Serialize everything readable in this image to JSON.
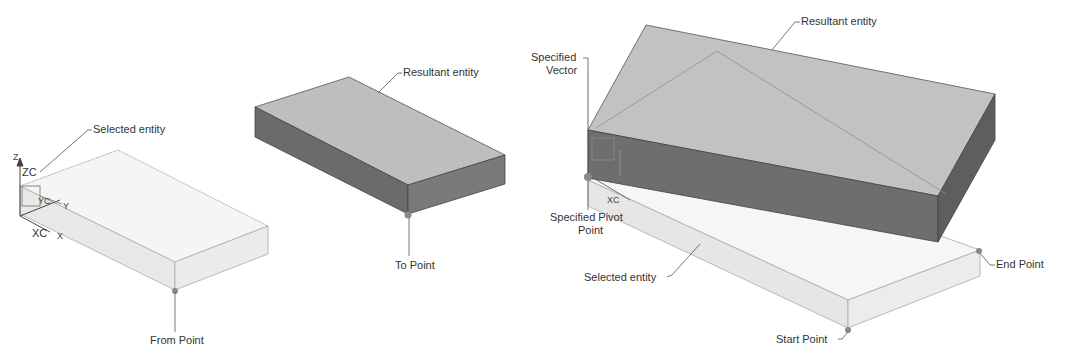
{
  "left_figure": {
    "labels": {
      "selected": "Selected entity",
      "resultant": "Resultant entity",
      "from": "From Point",
      "to": "To Point"
    },
    "axes": {
      "zc": "ZC",
      "yc": "YC",
      "xc": "XC",
      "z": "Z",
      "y": "Y",
      "x": "X"
    }
  },
  "right_figure": {
    "labels": {
      "resultant": "Resultant entity",
      "vector_line1": "Specified",
      "vector_line2": "Vector",
      "pivot_line1": "Specified Pivot",
      "pivot_line2": "Point",
      "selected": "Selected entity",
      "end": "End Point",
      "start": "Start Point"
    },
    "axes": {
      "xc": "XC"
    }
  },
  "colors": {
    "light_top": "#f4f4f4",
    "light_side": "#e6e6e6",
    "dark_top": "#bdbdbd",
    "dark_side": "#6a6a6a",
    "edge": "#555555",
    "leader": "#555555"
  }
}
